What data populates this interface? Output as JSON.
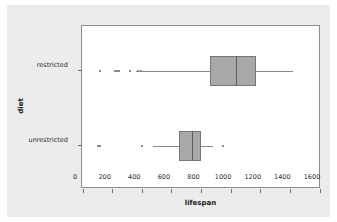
{
  "chart_data": {
    "type": "box",
    "title": "",
    "xlabel": "lifespan",
    "ylabel": "diet",
    "xlim": [
      0,
      1600
    ],
    "xticks": [
      0,
      200,
      400,
      600,
      800,
      1000,
      1200,
      1400,
      1600
    ],
    "xticklabels": [
      "0",
      "200",
      "400",
      "600",
      "800",
      "1000",
      "1200",
      "1400",
      "1600"
    ],
    "categories": [
      "restricted",
      "unrestricted"
    ],
    "grid": false,
    "legend": "none",
    "orientation": "horizontal",
    "box_fill": "#a8a8a8",
    "box_edge": "#777777",
    "series": [
      {
        "name": "restricted",
        "whisker_low": 355,
        "q1": 855,
        "median": 1035,
        "q3": 1165,
        "whisker_high": 1420,
        "outliers": [
          115,
          215,
          228,
          242,
          315,
          372,
          392
        ]
      },
      {
        "name": "unrestricted",
        "whisker_low": 470,
        "q1": 645,
        "median": 735,
        "q3": 795,
        "whisker_high": 875,
        "outliers": [
          103,
          113,
          400,
          945
        ]
      }
    ]
  }
}
